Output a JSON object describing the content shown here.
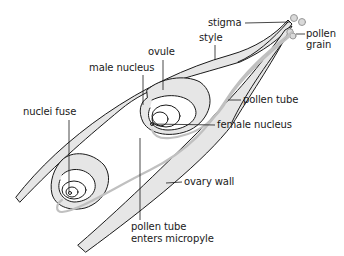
{
  "diagram": {
    "colors": {
      "outline": "#1a1a1a",
      "fill": "#e6e6e6",
      "pollen_tube": "#c8c8c8",
      "leader": "#1a1a1a",
      "text": "#1a1a1a"
    },
    "labels": {
      "stigma": "stigma",
      "style": "style",
      "pollen_grain_line1": "pollen",
      "pollen_grain_line2": "grain",
      "ovule": "ovule",
      "male_nucleus": "male nucleus",
      "nuclei_fuse": "nuclei fuse",
      "pollen_tube": "pollen tube",
      "female_nucleus": "female nucleus",
      "ovary_wall": "ovary wall",
      "micropyle_line1": "pollen tube",
      "micropyle_line2": "enters micropyle"
    }
  }
}
